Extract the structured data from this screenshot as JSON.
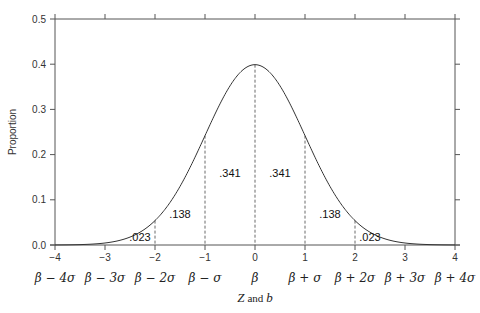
{
  "chart_data": {
    "type": "line",
    "title": "",
    "xlabel": "Z and b",
    "xlabel_parts": {
      "z": "Z",
      "and": "and",
      "b": "b"
    },
    "ylabel": "Proportion",
    "xlim": [
      -4,
      4
    ],
    "ylim": [
      0.0,
      0.5
    ],
    "grid": false,
    "x_ticks": [
      "-4",
      "-3",
      "-2",
      "-1",
      "0",
      "1",
      "2",
      "3",
      "4"
    ],
    "x_ticks_secondary": [
      "β-4σ",
      "β-3σ",
      "β-2σ",
      "β-σ",
      "β",
      "β+σ",
      "β+2σ",
      "β+3σ",
      "β+4σ"
    ],
    "y_ticks": [
      "0.0",
      "0.1",
      "0.2",
      "0.3",
      "0.4",
      "0.5"
    ],
    "series": [
      {
        "name": "Standard normal density",
        "function": "exp(-x^2/2)/sqrt(2*pi)",
        "peak": 0.399
      }
    ],
    "vertical_dashed_lines_at": [
      -2,
      -1,
      0,
      1,
      2
    ],
    "region_labels": [
      {
        "text": ".023",
        "x": -2.3,
        "y": 0.008
      },
      {
        "text": ".138",
        "x": -1.5,
        "y": 0.06
      },
      {
        "text": ".341",
        "x": -0.5,
        "y": 0.15
      },
      {
        "text": ".341",
        "x": 0.5,
        "y": 0.15
      },
      {
        "text": ".138",
        "x": 1.5,
        "y": 0.06
      },
      {
        "text": ".023",
        "x": 2.3,
        "y": 0.008
      }
    ]
  }
}
